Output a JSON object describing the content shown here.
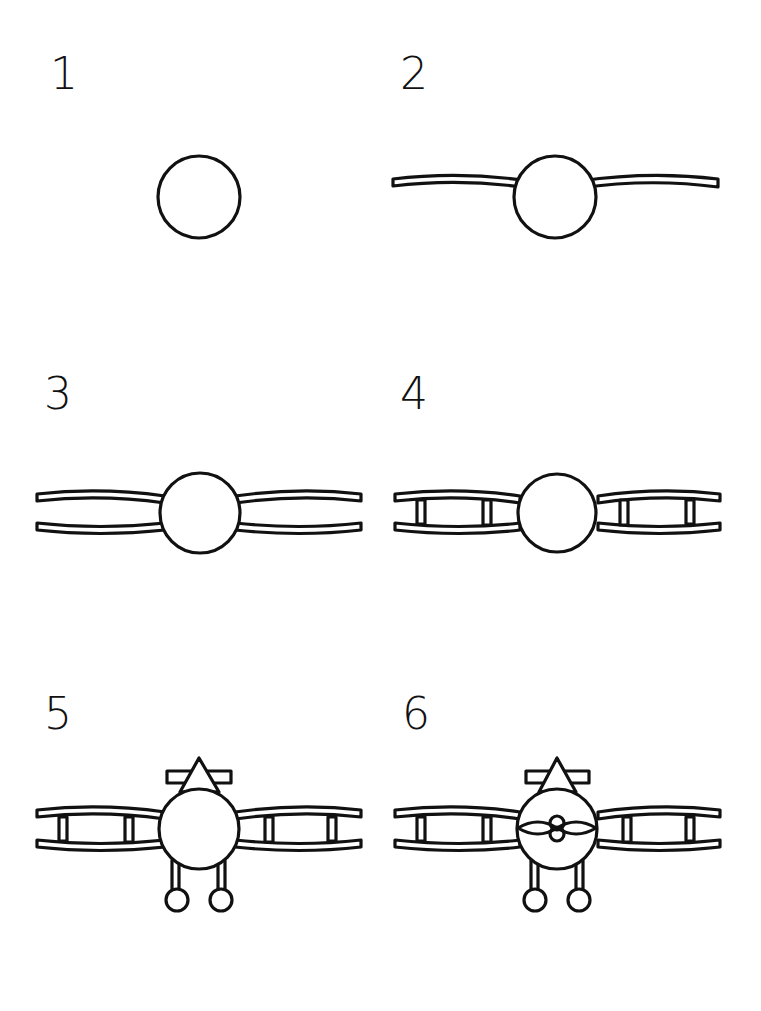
{
  "steps": [
    {
      "number": "1",
      "description": "Draw a circle for the fuselage",
      "parts": [
        "fuselage"
      ]
    },
    {
      "number": "2",
      "description": "Add a thin curved upper wing through the circle",
      "parts": [
        "fuselage",
        "upper-wing"
      ]
    },
    {
      "number": "3",
      "description": "Add the lower wing",
      "parts": [
        "fuselage",
        "upper-wing",
        "lower-wing"
      ]
    },
    {
      "number": "4",
      "description": "Add wing struts between the wings",
      "parts": [
        "fuselage",
        "upper-wing",
        "lower-wing",
        "struts"
      ]
    },
    {
      "number": "5",
      "description": "Add the tail fin, tailplane and landing gear wheels",
      "parts": [
        "fuselage",
        "upper-wing",
        "lower-wing",
        "struts",
        "tail",
        "landing-gear"
      ]
    },
    {
      "number": "6",
      "description": "Add the propeller",
      "parts": [
        "fuselage",
        "upper-wing",
        "lower-wing",
        "struts",
        "tail",
        "landing-gear",
        "propeller"
      ]
    }
  ],
  "colors": {
    "ink": "#111111",
    "paper": "#ffffff"
  }
}
